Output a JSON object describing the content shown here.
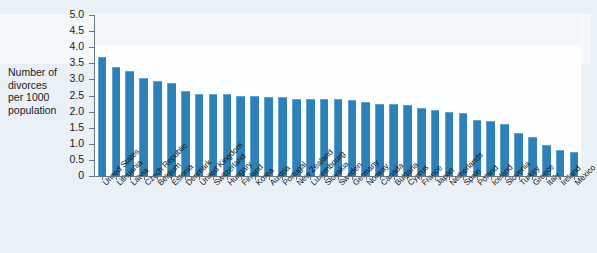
{
  "chart_data": {
    "type": "bar",
    "title": "",
    "xlabel": "",
    "ylabel": "Number of divorces per 1000 population",
    "ylim": [
      0,
      5.0
    ],
    "ytick_step": 0.5,
    "grid": false,
    "legend": "none",
    "orientation": "vertical",
    "bar_color": "#2e80b8",
    "yticks": [
      "0",
      "0.5",
      "1.0",
      "1.5",
      "2.0",
      "2.5",
      "3.0",
      "3.5",
      "4.0",
      "4.5",
      "5.0"
    ],
    "categories": [
      "United States",
      "Lithuania",
      "Latvia",
      "Czech Republic",
      "Belgium",
      "Estonia",
      "Denmark",
      "United Kingdom",
      "Switzerland",
      "Hungary",
      "Finland",
      "Korea",
      "Austria",
      "Portugal",
      "New Zealand",
      "Luxembourg",
      "Slovakia",
      "Sweden",
      "Germany",
      "Norway",
      "Canada",
      "Bulgaria",
      "Cyprus",
      "France",
      "Japan",
      "Netherlands",
      "Spain",
      "Poland",
      "Iceland",
      "Slovenia",
      "Turkey",
      "Greece",
      "Italy",
      "Ireland",
      "Mexico"
    ],
    "values": [
      3.7,
      3.4,
      3.25,
      3.05,
      2.95,
      2.9,
      2.65,
      2.55,
      2.55,
      2.55,
      2.5,
      2.5,
      2.45,
      2.45,
      2.4,
      2.4,
      2.4,
      2.4,
      2.35,
      2.3,
      2.25,
      2.25,
      2.2,
      2.1,
      2.05,
      2.0,
      1.95,
      1.75,
      1.7,
      1.6,
      1.35,
      1.2,
      0.95,
      0.8,
      0.75
    ]
  },
  "y_axis_label_lines": [
    "Number of",
    "divorces",
    "per 1000",
    "population"
  ],
  "bleed_through": {
    "title": "Main Models",
    "subtitle": "The case for and against marriage"
  }
}
